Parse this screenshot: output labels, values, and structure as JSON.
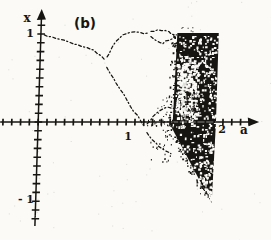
{
  "style": {
    "ink": "#171512",
    "paper": "#fbfaf7",
    "noise": "#b8b3ab"
  },
  "chart_data": {
    "type": "scatter",
    "subtype": "bifurcation-diagram",
    "title": "(b)",
    "xlabel": "a",
    "ylabel": "x",
    "xlim": [
      -0.42,
      2.5
    ],
    "ylim": [
      -1.25,
      1.28
    ],
    "grid": false,
    "x_ticks": {
      "min": -0.4,
      "max": 2.4,
      "step": 0.1
    },
    "y_ticks": {
      "min": -1.1,
      "max": 1.1,
      "step": 0.1
    },
    "x_tick_labels": [
      {
        "value": 1,
        "text": "1"
      },
      {
        "value": 2,
        "text": "2"
      }
    ],
    "y_tick_labels": [
      {
        "value": 1,
        "text": "1"
      },
      {
        "value": -1,
        "text": "- 1"
      }
    ],
    "branches": [
      {
        "name": "period-1",
        "points": [
          [
            0.04,
            0.99
          ],
          [
            0.12,
            0.97
          ],
          [
            0.22,
            0.94
          ],
          [
            0.32,
            0.91
          ],
          [
            0.42,
            0.88
          ],
          [
            0.52,
            0.85
          ],
          [
            0.6,
            0.82
          ],
          [
            0.68,
            0.76
          ],
          [
            0.74,
            0.7
          ]
        ]
      },
      {
        "name": "period-2-upper",
        "points": [
          [
            0.76,
            0.74
          ],
          [
            0.8,
            0.82
          ],
          [
            0.86,
            0.92
          ],
          [
            0.93,
            0.99
          ],
          [
            1.02,
            1.02
          ],
          [
            1.12,
            1.02
          ],
          [
            1.22,
            1.01
          ]
        ]
      },
      {
        "name": "period-4-upper-a",
        "points": [
          [
            1.25,
            1.03
          ],
          [
            1.33,
            1.05
          ],
          [
            1.41,
            1.04
          ],
          [
            1.48,
            1.0
          ],
          [
            1.53,
            0.99
          ]
        ]
      },
      {
        "name": "period-4-upper-b",
        "points": [
          [
            1.25,
            0.97
          ],
          [
            1.32,
            0.92
          ],
          [
            1.39,
            0.89
          ],
          [
            1.46,
            0.93
          ],
          [
            1.52,
            0.97
          ]
        ]
      },
      {
        "name": "period-2-lower",
        "points": [
          [
            0.76,
            0.62
          ],
          [
            0.84,
            0.5
          ],
          [
            0.92,
            0.37
          ],
          [
            1.0,
            0.25
          ],
          [
            1.08,
            0.12
          ],
          [
            1.16,
            0.02
          ],
          [
            1.22,
            -0.06
          ]
        ]
      },
      {
        "name": "period-4-lower-a",
        "points": [
          [
            1.24,
            -0.02
          ],
          [
            1.3,
            0.06
          ],
          [
            1.38,
            0.13
          ],
          [
            1.46,
            0.17
          ],
          [
            1.52,
            0.15
          ]
        ]
      },
      {
        "name": "period-4-lower-b",
        "points": [
          [
            1.24,
            -0.12
          ],
          [
            1.3,
            -0.2
          ],
          [
            1.38,
            -0.28
          ],
          [
            1.46,
            -0.33
          ],
          [
            1.52,
            -0.36
          ]
        ]
      }
    ],
    "chaotic_regions": [
      {
        "name": "above-axis-band",
        "polygon": [
          [
            1.53,
            0.01
          ],
          [
            1.55,
            1.01
          ],
          [
            2.02,
            1.01
          ],
          [
            2.02,
            0.01
          ]
        ]
      },
      {
        "name": "below-axis-band",
        "polygon": [
          [
            1.49,
            -0.01
          ],
          [
            2.02,
            -0.01
          ],
          [
            2.0,
            -0.92
          ]
        ]
      }
    ],
    "periodic_windows": [
      {
        "a_range": [
          1.62,
          1.675
        ],
        "x_range": [
          0.02,
          0.55
        ]
      },
      {
        "a_range": [
          1.73,
          1.76
        ],
        "x_range": [
          0.0,
          0.35
        ]
      }
    ]
  }
}
